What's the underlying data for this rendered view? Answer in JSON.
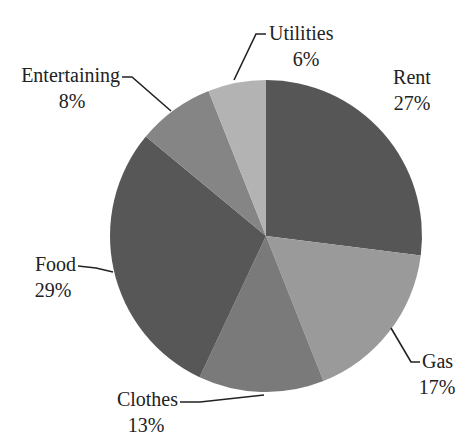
{
  "chart_data": {
    "type": "pie",
    "title": "",
    "title_note": "Title is cropped off at the top edge of the image; only descender fragments are visible.",
    "categories": [
      "Rent",
      "Gas",
      "Clothes",
      "Food",
      "Entertaining",
      "Utilities"
    ],
    "values": [
      27,
      17,
      13,
      29,
      8,
      6
    ],
    "unit": "%",
    "labels": [
      {
        "name": "Rent",
        "pct": "27%"
      },
      {
        "name": "Gas",
        "pct": "17%"
      },
      {
        "name": "Clothes",
        "pct": "13%"
      },
      {
        "name": "Food",
        "pct": "29%"
      },
      {
        "name": "Entertaining",
        "pct": "8%"
      },
      {
        "name": "Utilities",
        "pct": "6%"
      }
    ],
    "colors": [
      "#565656",
      "#9a9a9a",
      "#7a7a7a",
      "#575757",
      "#858585",
      "#b3b3b3"
    ],
    "start_angle": "12 o'clock",
    "direction": "clockwise",
    "legend": "none (leader-line labels)"
  }
}
